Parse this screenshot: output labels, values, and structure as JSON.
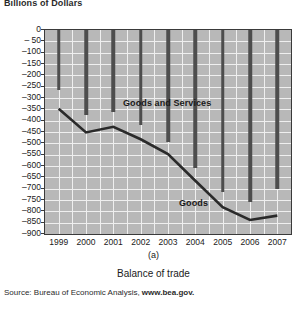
{
  "figure": {
    "axis_title": "Billions of Dollars",
    "panel_label": "(a)",
    "caption": "Balance of trade",
    "source_prefix": "Source: Bureau of Economic Analysis, ",
    "source_url": "www.bea.gov."
  },
  "chart_data": {
    "type": "bar",
    "title": "Balance of trade",
    "subtitle": "(a)",
    "xlabel": "",
    "ylabel": "Billions of Dollars",
    "categories": [
      "1999",
      "2000",
      "2001",
      "2002",
      "2003",
      "2004",
      "2005",
      "2006",
      "2007"
    ],
    "ylim": [
      -900,
      0
    ],
    "ytick_step": 50,
    "yticks": [
      0,
      -50,
      -100,
      -150,
      -200,
      -250,
      -300,
      -350,
      -400,
      -450,
      -500,
      -550,
      -600,
      -650,
      -700,
      -750,
      -800,
      -850,
      -900
    ],
    "ytick_labels": [
      "0",
      "– 50",
      "–100",
      "–150",
      "–200",
      "–250",
      "–300",
      "–350",
      "–400",
      "–450",
      "–500",
      "–550",
      "–600",
      "–650",
      "–700",
      "–750",
      "–800",
      "–850",
      "–900"
    ],
    "grid": true,
    "legend_position": "inline-annotations",
    "series": [
      {
        "name": "Goods and Services",
        "type": "bar",
        "color": "#4d4d4d",
        "values": [
          -265,
          -377,
          -362,
          -421,
          -495,
          -610,
          -714,
          -759,
          -701
        ]
      },
      {
        "name": "Goods",
        "type": "line",
        "color": "#2a2a2a",
        "values": [
          -347,
          -452,
          -427,
          -482,
          -547,
          -665,
          -782,
          -838,
          -819
        ]
      }
    ],
    "annotations": [
      {
        "text": "Goods and Services",
        "x": "2001",
        "y": -235
      },
      {
        "text": "Goods",
        "x": "2003",
        "y": -600
      }
    ]
  },
  "colors": {
    "plot_background": "#b8b8b8",
    "gridline": "#efefef",
    "axis": "#3a3a3a",
    "bar": "#4d4d4d",
    "line": "#2a2a2a",
    "text": "#1a1a1a"
  }
}
